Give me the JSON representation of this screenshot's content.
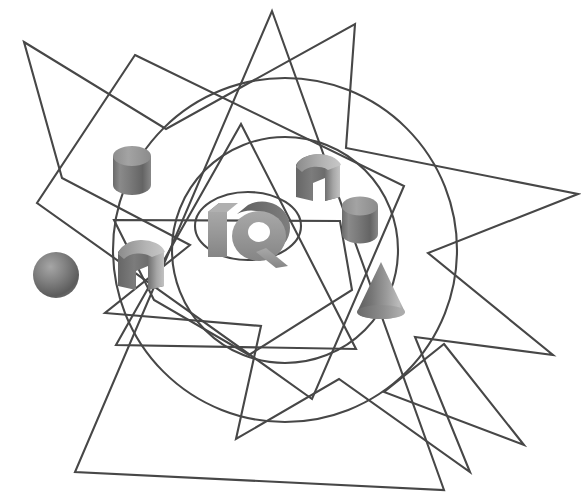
{
  "figure": {
    "title": "IQ",
    "logo_text": "IQ",
    "background_color": "#ffffff",
    "stroke_color": "#474747",
    "stroke_width": 2.1,
    "width": 581,
    "height": 497
  },
  "palette": {
    "solid_light": "#b9b9b9",
    "solid_mid": "#8e8e8e",
    "solid_dark": "#5e5e5e",
    "solid_darkest": "#4a4a4a",
    "logo_face": "#9a9a9a",
    "logo_side": "#6d6d6d",
    "outline": "#474747",
    "background": "#ffffff"
  },
  "outline_shapes": [
    {
      "name": "five-point-star",
      "type": "polygon",
      "points": "24,42 166,129 355,24 346,148 578,194 428,253 553,355 415,337 470,472 339,379 236,439 261,326 105,313 190,245 62,178"
    },
    {
      "name": "rotated-square",
      "type": "polygon",
      "points": "135,55 404,186 312,399 37,203"
    },
    {
      "name": "large-triangle",
      "type": "polygon",
      "points": "272,11 444,490 75,472"
    },
    {
      "name": "upright-triangle",
      "type": "polygon",
      "points": "241,124 356,349 116,345"
    },
    {
      "name": "inner-pentagon",
      "type": "polygon",
      "points": "114,220 340,221 352,290 249,355 154,300"
    },
    {
      "name": "thin-wedge-triangle",
      "type": "polygon",
      "points": "444,344 524,445 384,392"
    },
    {
      "name": "outer-circle",
      "type": "circle",
      "cx": 285,
      "cy": 250,
      "r": 172
    },
    {
      "name": "inner-circle",
      "type": "circle",
      "cx": 285,
      "cy": 250,
      "r": 113
    },
    {
      "name": "logo-ellipse",
      "type": "ellipse",
      "cx": 248,
      "cy": 226,
      "rx": 53,
      "ry": 34
    }
  ],
  "solids": [
    {
      "name": "cylinder-upper-left",
      "shape": "cylinder",
      "cx": 132,
      "cy": 168,
      "width": 38,
      "height": 46,
      "shading": "vertical-gradient"
    },
    {
      "name": "sphere-left",
      "shape": "sphere",
      "cx": 56,
      "cy": 275,
      "radius": 23,
      "shading": "radial-highlight"
    },
    {
      "name": "rounded-box-left",
      "shape": "rounded-box",
      "cx": 141,
      "cy": 266,
      "width": 48,
      "height": 48,
      "shading": "two-face"
    },
    {
      "name": "rounded-box-right",
      "shape": "rounded-box",
      "cx": 318,
      "cy": 178,
      "width": 46,
      "height": 46,
      "shading": "two-face"
    },
    {
      "name": "cylinder-right",
      "shape": "cylinder",
      "cx": 360,
      "cy": 218,
      "width": 36,
      "height": 45,
      "shading": "vertical-gradient"
    },
    {
      "name": "cone-lower-right",
      "shape": "cone",
      "cx": 381,
      "cy": 291,
      "width": 48,
      "height": 57,
      "shading": "vertical-gradient"
    }
  ],
  "logo": {
    "text": "IQ",
    "x": 208,
    "y": 200,
    "width": 84,
    "height": 56,
    "style": "extruded-3d",
    "face_color": "#9a9a9a",
    "extrusion_color": "#6d6d6d"
  }
}
